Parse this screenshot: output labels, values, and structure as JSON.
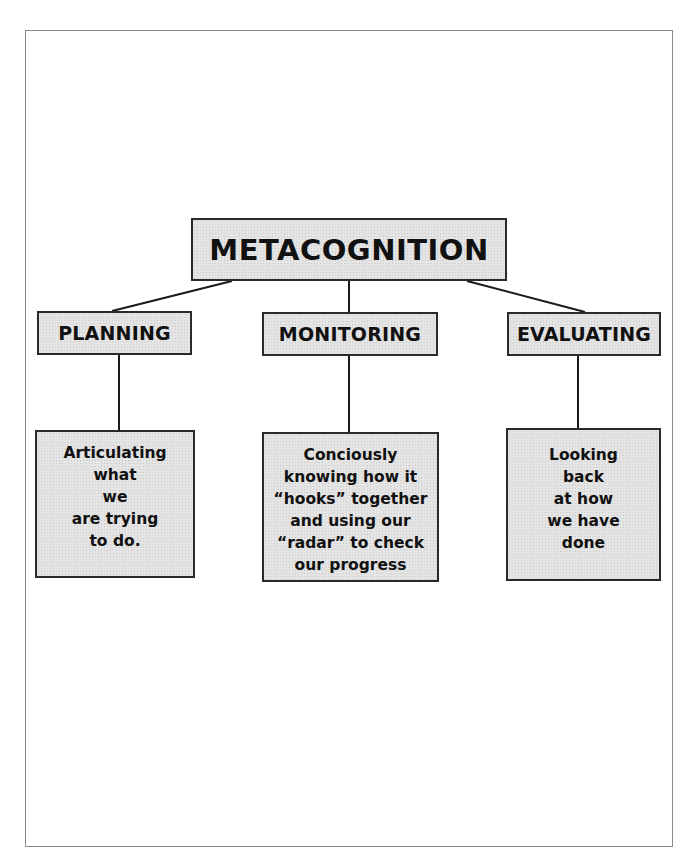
{
  "diagram": {
    "root": {
      "label": "METACOGNITION"
    },
    "branches": [
      {
        "label": "PLANNING",
        "description": "Articulating\nwhat\nwe\nare trying\nto do."
      },
      {
        "label": "MONITORING",
        "description": "Conciously\nknowing how it\n“hooks” together\nand using our\n“radar” to check\nour progress"
      },
      {
        "label": "EVALUATING",
        "description": "Looking\nback\nat how\nwe have\ndone"
      }
    ],
    "colors": {
      "box_fill": "#e4e4e4",
      "border": "#2a2a2a",
      "frame": "#8a8a8a"
    }
  }
}
